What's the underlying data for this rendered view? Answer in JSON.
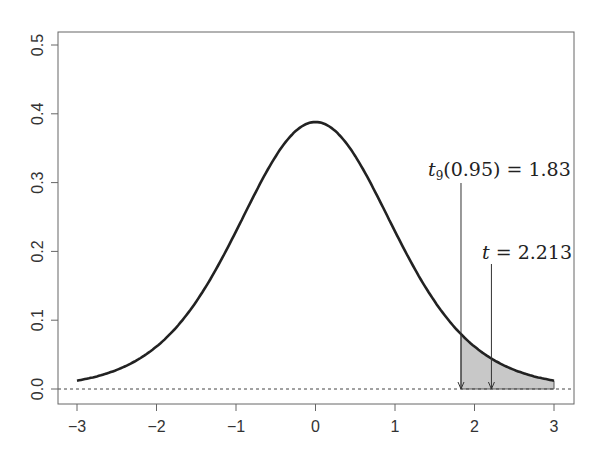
{
  "chart_data": {
    "type": "line",
    "title": "",
    "xlabel": "",
    "ylabel": "",
    "xlim": [
      -3,
      3
    ],
    "ylim": [
      0,
      0.5
    ],
    "x_ticks": [
      "-3",
      "-2",
      "-1",
      "0",
      "1",
      "2",
      "3"
    ],
    "y_ticks": [
      "0.0",
      "0.1",
      "0.2",
      "0.3",
      "0.4",
      "0.5"
    ],
    "grid": false,
    "series": [
      {
        "name": "t density (df = 9)",
        "x": [
          -3.0,
          -2.5,
          -2.0,
          -1.5,
          -1.0,
          -0.5,
          0.0,
          0.5,
          1.0,
          1.5,
          2.0,
          2.5,
          3.0
        ],
        "values": [
          0.011,
          0.025,
          0.06,
          0.125,
          0.23,
          0.341,
          0.388,
          0.341,
          0.23,
          0.125,
          0.06,
          0.025,
          0.011
        ]
      }
    ],
    "shaded_region": {
      "from": 1.83,
      "to": 3.0,
      "color": "#c8c8c8"
    },
    "reference_line": {
      "y": 0,
      "style": "dotted"
    },
    "annotations": [
      {
        "text_base": "t",
        "subscript": "9",
        "text_rest": "(0.95) = 1.83",
        "x": 1.83
      },
      {
        "text_base": "t",
        "text_rest": " = 2.213",
        "x": 2.213
      }
    ]
  },
  "colors": {
    "curve": "#222222",
    "shade": "#c8c8c8",
    "axis": "#555555"
  }
}
